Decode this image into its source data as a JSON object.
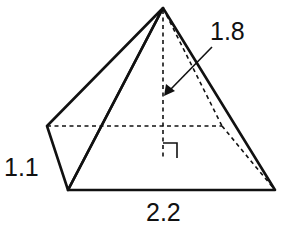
{
  "diagram": {
    "type": "pyramid-rectangular-base",
    "labels": {
      "height": "1.8",
      "width": "1.1",
      "length": "2.2"
    },
    "vertices": {
      "apex": [
        163,
        8
      ],
      "back_left": [
        47,
        126
      ],
      "front_left": [
        68,
        190
      ],
      "front_right": [
        275,
        190
      ],
      "back_right": [
        222,
        126
      ],
      "height_foot": [
        163,
        158
      ]
    },
    "colors": {
      "stroke": "#111111",
      "background": "#ffffff"
    }
  }
}
